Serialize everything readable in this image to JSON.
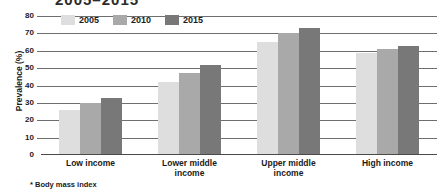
{
  "title_partial": "2005–2015",
  "footnote": "* Body mass index",
  "axis": {
    "ylabel": "Prevalence (%)",
    "yticks": [
      "80",
      "70",
      "60",
      "50",
      "40",
      "30",
      "20",
      "10",
      "0"
    ]
  },
  "legend": {
    "items": [
      {
        "label": "2005",
        "color": "#dedede"
      },
      {
        "label": "2010",
        "color": "#a9a9a9"
      },
      {
        "label": "2015",
        "color": "#787878"
      }
    ]
  },
  "categories_display": [
    [
      "Low income"
    ],
    [
      "Lower middle",
      "income"
    ],
    [
      "Upper middle",
      "income"
    ],
    [
      "High income"
    ]
  ],
  "chart_data": {
    "type": "bar",
    "title": "2005–2015",
    "xlabel": "",
    "ylabel": "Prevalence (%)",
    "ylim": [
      0,
      80
    ],
    "ytick_step": 10,
    "grid": true,
    "legend_position": "top-left-inside",
    "categories": [
      "Low income",
      "Lower middle income",
      "Upper middle income",
      "High income"
    ],
    "series": [
      {
        "name": "2005",
        "color": "#dedede",
        "values": [
          26,
          42,
          65,
          59
        ]
      },
      {
        "name": "2010",
        "color": "#a9a9a9",
        "values": [
          30,
          47,
          70,
          61
        ]
      },
      {
        "name": "2015",
        "color": "#787878",
        "values": [
          33,
          52,
          73,
          63
        ]
      }
    ],
    "annotations": [
      "* Body mass index"
    ]
  }
}
